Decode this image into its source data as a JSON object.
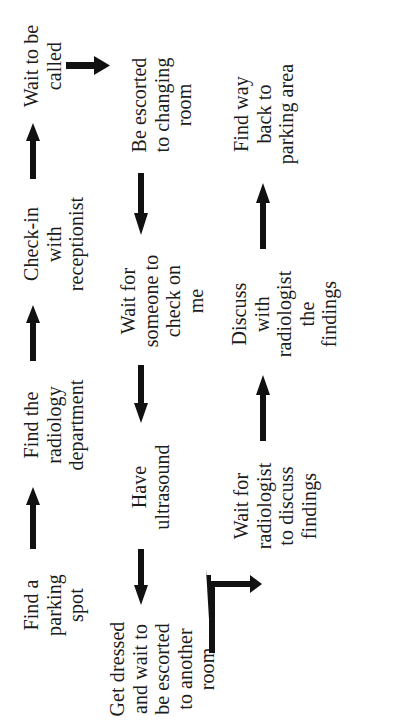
{
  "diagram": {
    "orientation": "rotated-90-ccw",
    "background_color": "#ffffff",
    "ink_color": "#111111",
    "nodes": [
      {
        "id": "n1",
        "label": "Find a\nparking\nspot"
      },
      {
        "id": "n2",
        "label": "Find the\nradiology\ndepartment"
      },
      {
        "id": "n3",
        "label": "Check-in\nwith\nreceptionist"
      },
      {
        "id": "n4",
        "label": "Wait to be\ncalled"
      },
      {
        "id": "n5",
        "label": "Be escorted\nto changing\nroom"
      },
      {
        "id": "n6",
        "label": "Wait for\nsomeone to\ncheck on\nme"
      },
      {
        "id": "n7",
        "label": "Have\nultrasound"
      },
      {
        "id": "n8",
        "label": "Get dressed\nand wait to\nbe escorted\nto another\nroom"
      },
      {
        "id": "n9",
        "label": "Wait for\nradiologist\nto discuss\nfindings"
      },
      {
        "id": "n10",
        "label": "Discuss\nwith\nradiologist\nthe\nfindings"
      },
      {
        "id": "n11",
        "label": "Find way\nback to\nparking area"
      }
    ],
    "edges": [
      {
        "id": "e1",
        "from": "n1",
        "to": "n2",
        "style": "straight",
        "direction": "right"
      },
      {
        "id": "e2",
        "from": "n2",
        "to": "n3",
        "style": "straight",
        "direction": "right"
      },
      {
        "id": "e3",
        "from": "n3",
        "to": "n4",
        "style": "straight",
        "direction": "right"
      },
      {
        "id": "e4",
        "from": "n4",
        "to": "n5",
        "style": "straight",
        "direction": "down"
      },
      {
        "id": "e5",
        "from": "n5",
        "to": "n6",
        "style": "straight",
        "direction": "left"
      },
      {
        "id": "e6",
        "from": "n6",
        "to": "n7",
        "style": "straight",
        "direction": "left"
      },
      {
        "id": "e7",
        "from": "n7",
        "to": "n8",
        "style": "straight",
        "direction": "left"
      },
      {
        "id": "e8",
        "from": "n8",
        "to": "n9",
        "style": "elbow",
        "direction": "down-then-right"
      },
      {
        "id": "e9",
        "from": "n9",
        "to": "n10",
        "style": "straight",
        "direction": "right"
      },
      {
        "id": "e10",
        "from": "n10",
        "to": "n11",
        "style": "straight",
        "direction": "right"
      }
    ]
  }
}
